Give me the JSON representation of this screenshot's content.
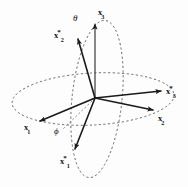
{
  "figure": {
    "background_color": "#fdfdfd",
    "line_color": "#1a1a1a",
    "dashed_color": "#555555",
    "width": 188,
    "height": 187,
    "origin": {
      "x": 95,
      "y": 98
    }
  },
  "labels": {
    "x3": {
      "base": "x",
      "star": "",
      "sub": "3",
      "x": 98,
      "y": 6
    },
    "x2star": {
      "base": "x",
      "star": "*",
      "sub": "2",
      "x": 54,
      "y": 29
    },
    "x3star": {
      "base": "x",
      "star": "*",
      "sub": "3",
      "x": 166,
      "y": 85
    },
    "x2": {
      "base": "x",
      "star": "",
      "sub": "2",
      "x": 158,
      "y": 112
    },
    "x1": {
      "base": "x",
      "star": "",
      "sub": "1",
      "x": 24,
      "y": 121
    },
    "x1star": {
      "base": "x",
      "star": "*",
      "sub": "1",
      "x": 60,
      "y": 155
    }
  },
  "angles": {
    "theta": {
      "symbol": "θ",
      "x": 73,
      "y": 14
    },
    "phi": {
      "symbol": "ϕ",
      "x": 54,
      "y": 127
    }
  },
  "vectors": [
    {
      "name": "x3-axis",
      "label": "x3",
      "from": [
        95,
        98
      ],
      "to": [
        95,
        22
      ]
    },
    {
      "name": "x2star-axis",
      "label": "x2star",
      "from": [
        95,
        98
      ],
      "to": [
        77,
        37
      ]
    },
    {
      "name": "x3star-axis",
      "label": "x3star",
      "from": [
        95,
        98
      ],
      "to": [
        164,
        91
      ]
    },
    {
      "name": "x2-axis",
      "label": "x2",
      "from": [
        95,
        98
      ],
      "to": [
        156,
        111
      ]
    },
    {
      "name": "x1-axis",
      "label": "x1",
      "from": [
        95,
        98
      ],
      "to": [
        37,
        122
      ]
    },
    {
      "name": "x1star-axis",
      "label": "x1star",
      "from": [
        95,
        98
      ],
      "to": [
        73,
        152
      ]
    }
  ],
  "ellipses": [
    {
      "name": "equatorial-circle",
      "style": "dashed",
      "cx": 93,
      "cy": 99,
      "rx": 81,
      "ry": 26,
      "rotation": -3
    },
    {
      "name": "meridian-circle",
      "style": "dashed",
      "cx": 97,
      "cy": 99,
      "rx": 25,
      "ry": 79,
      "rotation": 6
    }
  ]
}
